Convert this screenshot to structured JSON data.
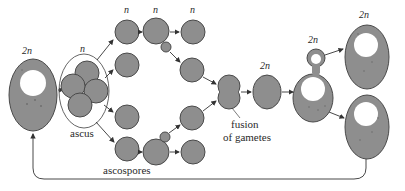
{
  "figure": {
    "labels": {
      "ascus": "ascus",
      "ascospores": "ascospores",
      "fusion_line1": "fusion",
      "fusion_line2": "of gametes"
    },
    "ploidy": {
      "diploid_start": "2n",
      "ascus": "n",
      "spore_col1": "n",
      "spore_col2": "n",
      "spore_col3": "n",
      "zygote": "2n",
      "budding_diploid": "2n",
      "daughter_diploid": "2n"
    },
    "colors": {
      "cell_fill": "#8e8e8e",
      "cell_outline": "#4a4a4a",
      "nucleus": "#ffffff",
      "arrow": "#333333"
    }
  }
}
